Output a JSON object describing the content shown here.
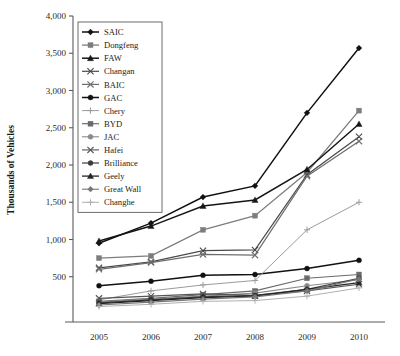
{
  "chart_data": {
    "type": "line",
    "title": "",
    "xlabel": "",
    "ylabel": "Thousands of Vehicles",
    "categories": [
      "2005",
      "2006",
      "2007",
      "2008",
      "2009",
      "2010"
    ],
    "x": [
      2005,
      2006,
      2007,
      2008,
      2009,
      2010
    ],
    "ylim": [
      0,
      4000
    ],
    "ytick_labels": [
      "500",
      "1,000",
      "1,500",
      "2,000",
      "2,500",
      "3,000",
      "3,500",
      "4,000"
    ],
    "ytick_values": [
      500,
      1000,
      1500,
      2000,
      2500,
      3000,
      3500,
      4000
    ],
    "xtick_labels": [
      "2005",
      "2006",
      "2007",
      "2008",
      "2009",
      "2010"
    ],
    "grid": false,
    "legend_position": "upper-left-inside",
    "series": [
      {
        "name": "SAIC",
        "marker": "diamond",
        "color": "#111111",
        "width": 1.5,
        "values": [
          950,
          1220,
          1570,
          1720,
          2700,
          3570
        ]
      },
      {
        "name": "Dongfeng",
        "marker": "square",
        "color": "#7d7d7d",
        "width": 1.3,
        "values": [
          750,
          780,
          1130,
          1320,
          1900,
          2730
        ]
      },
      {
        "name": "FAW",
        "marker": "triangle",
        "color": "#161616",
        "width": 1.5,
        "values": [
          980,
          1180,
          1450,
          1530,
          1940,
          2550
        ]
      },
      {
        "name": "Changan",
        "marker": "cross",
        "color": "#4a4a4a",
        "width": 1.2,
        "values": [
          620,
          700,
          850,
          860,
          1870,
          2380
        ]
      },
      {
        "name": "BAIC",
        "marker": "cross",
        "color": "#6e6e6e",
        "width": 1.2,
        "values": [
          600,
          690,
          800,
          790,
          1850,
          2320
        ]
      },
      {
        "name": "GAC",
        "marker": "circle",
        "color": "#111111",
        "width": 1.5,
        "values": [
          380,
          440,
          520,
          530,
          610,
          720
        ]
      },
      {
        "name": "Chery",
        "marker": "plus",
        "color": "#9b9b9b",
        "width": 1.0,
        "values": [
          190,
          310,
          390,
          450,
          1130,
          1500
        ]
      },
      {
        "name": "BYD",
        "marker": "square",
        "color": "#6b6b6b",
        "width": 1.2,
        "values": [
          170,
          210,
          260,
          310,
          480,
          530
        ]
      },
      {
        "name": "JAC",
        "marker": "circle",
        "color": "#8a8a8a",
        "width": 1.1,
        "values": [
          160,
          200,
          240,
          280,
          380,
          460
        ]
      },
      {
        "name": "Hafei",
        "marker": "cross",
        "color": "#555555",
        "width": 1.1,
        "values": [
          210,
          240,
          270,
          250,
          310,
          400
        ]
      },
      {
        "name": "Brilliance",
        "marker": "circle",
        "color": "#3c3c3c",
        "width": 1.2,
        "values": [
          150,
          190,
          230,
          250,
          330,
          480
        ]
      },
      {
        "name": "Geely",
        "marker": "triangle",
        "color": "#232323",
        "width": 1.3,
        "values": [
          140,
          180,
          220,
          240,
          330,
          420
        ]
      },
      {
        "name": "Great Wall",
        "marker": "diamond",
        "color": "#777777",
        "width": 1.1,
        "values": [
          120,
          160,
          200,
          230,
          310,
          470
        ]
      },
      {
        "name": "Changhe",
        "marker": "plus",
        "color": "#b0b0b0",
        "width": 1.0,
        "values": [
          100,
          130,
          170,
          180,
          240,
          350
        ]
      }
    ]
  },
  "axis": {
    "y_title": "Thousands of Vehicles"
  }
}
